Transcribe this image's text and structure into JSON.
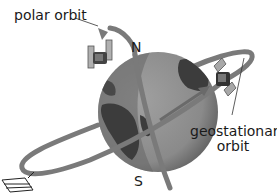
{
  "diagram": {
    "labels": {
      "polar_orbit": "polar orbit",
      "north": "N",
      "south": "S",
      "geostationary_line1": "geostationary",
      "geostationary_line2": "orbit"
    },
    "colors": {
      "orbit": "#7a7a7a",
      "ocean": "#8e8e8e",
      "land": "#3c3c3c",
      "shadow": "#555555",
      "text": "#1a1a1a"
    }
  }
}
